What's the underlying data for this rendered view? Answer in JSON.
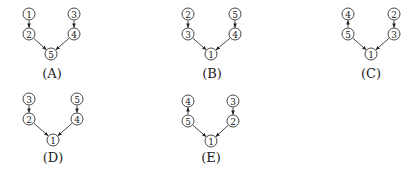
{
  "diagrams": [
    {
      "label": "(A)",
      "label_pos": [
        52,
        78
      ],
      "nodes": [
        {
          "id": "1",
          "text": "1",
          "x": 29,
          "y": 14
        },
        {
          "id": "3",
          "text": "3",
          "x": 74,
          "y": 14
        },
        {
          "id": "2",
          "text": "2",
          "x": 29,
          "y": 34
        },
        {
          "id": "4",
          "text": "4",
          "x": 74,
          "y": 34
        },
        {
          "id": "5",
          "text": "5",
          "x": 51,
          "y": 54
        }
      ],
      "edges": [
        {
          "from": "1",
          "to": "2"
        },
        {
          "from": "3",
          "to": "4"
        },
        {
          "from": "2",
          "to": "5"
        },
        {
          "from": "4",
          "to": "5"
        }
      ]
    },
    {
      "label": "(B)",
      "label_pos": [
        212,
        78
      ],
      "nodes": [
        {
          "id": "2",
          "text": "2",
          "x": 188,
          "y": 14
        },
        {
          "id": "5",
          "text": "5",
          "x": 235,
          "y": 14
        },
        {
          "id": "3",
          "text": "3",
          "x": 188,
          "y": 34
        },
        {
          "id": "4",
          "text": "4",
          "x": 235,
          "y": 34
        },
        {
          "id": "1",
          "text": "1",
          "x": 211,
          "y": 54
        }
      ],
      "edges": [
        {
          "from": "2",
          "to": "3"
        },
        {
          "from": "5",
          "to": "4"
        },
        {
          "from": "3",
          "to": "1"
        },
        {
          "from": "4",
          "to": "1"
        }
      ]
    },
    {
      "label": "(C)",
      "label_pos": [
        371,
        78
      ],
      "nodes": [
        {
          "id": "4",
          "text": "4",
          "x": 348,
          "y": 14
        },
        {
          "id": "2",
          "text": "2",
          "x": 394,
          "y": 14
        },
        {
          "id": "5",
          "text": "5",
          "x": 348,
          "y": 34
        },
        {
          "id": "3",
          "text": "3",
          "x": 394,
          "y": 34
        },
        {
          "id": "1",
          "text": "1",
          "x": 371,
          "y": 54
        }
      ],
      "edges": [
        {
          "from": "5",
          "to": "4"
        },
        {
          "from": "2",
          "to": "3"
        },
        {
          "from": "5",
          "to": "1"
        },
        {
          "from": "3",
          "to": "1"
        }
      ]
    },
    {
      "label": "(D)",
      "label_pos": [
        53,
        162
      ],
      "nodes": [
        {
          "id": "3",
          "text": "3",
          "x": 29,
          "y": 99
        },
        {
          "id": "5",
          "text": "5",
          "x": 77,
          "y": 99
        },
        {
          "id": "2",
          "text": "2",
          "x": 29,
          "y": 119
        },
        {
          "id": "4",
          "text": "4",
          "x": 77,
          "y": 119
        },
        {
          "id": "1",
          "text": "1",
          "x": 53,
          "y": 140
        }
      ],
      "edges": [
        {
          "from": "3",
          "to": "2"
        },
        {
          "from": "5",
          "to": "4"
        },
        {
          "from": "2",
          "to": "1"
        },
        {
          "from": "4",
          "to": "1"
        }
      ]
    },
    {
      "label": "(E)",
      "label_pos": [
        211,
        162
      ],
      "nodes": [
        {
          "id": "4",
          "text": "4",
          "x": 188,
          "y": 101
        },
        {
          "id": "3",
          "text": "3",
          "x": 233,
          "y": 101
        },
        {
          "id": "5",
          "text": "5",
          "x": 188,
          "y": 121
        },
        {
          "id": "2",
          "text": "2",
          "x": 233,
          "y": 121
        },
        {
          "id": "1",
          "text": "1",
          "x": 211,
          "y": 141
        }
      ],
      "edges": [
        {
          "from": "5",
          "to": "4"
        },
        {
          "from": "3",
          "to": "2"
        },
        {
          "from": "5",
          "to": "1"
        },
        {
          "from": "2",
          "to": "1"
        }
      ]
    }
  ],
  "style": {
    "node_radius": 6,
    "stroke_color": "#333333",
    "background": "#ffffff"
  }
}
